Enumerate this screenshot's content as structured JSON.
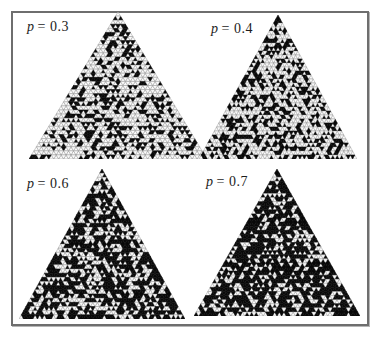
{
  "figure": {
    "type": "percolation-triangle-lattice-panels",
    "panels": [
      {
        "var": "p",
        "eq": "= 0.3",
        "label": "p = 0.3",
        "p": 0.3
      },
      {
        "var": "p",
        "eq": "= 0.4",
        "label": "p = 0.4",
        "p": 0.4
      },
      {
        "var": "p",
        "eq": "= 0.6",
        "label": "p = 0.6",
        "p": 0.6
      },
      {
        "var": "p",
        "eq": "= 0.7",
        "label": "p = 0.7",
        "p": 0.7
      }
    ],
    "lattice": {
      "rows": 36
    },
    "colors": {
      "occupied_cell": "#0a0a0a",
      "empty_cell_fill": "#fafafa",
      "lattice_outline": "#8d8d8d",
      "frame_border": "#6e6e6e",
      "background": "#ffffff",
      "label_text": "#1c1c1c"
    }
  }
}
